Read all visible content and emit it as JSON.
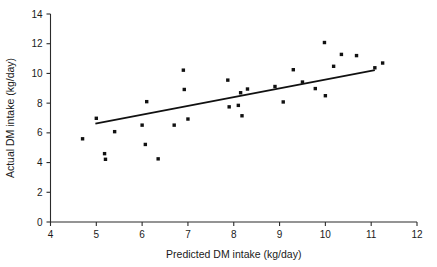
{
  "chart_data": {
    "type": "scatter",
    "title": "",
    "xlabel": "Predicted DM intake (kg/day)",
    "ylabel": "Actual DM intake (kg/day)",
    "xlim": [
      4,
      12
    ],
    "ylim": [
      0,
      14
    ],
    "xticks": [
      4,
      5,
      6,
      7,
      8,
      9,
      10,
      11,
      12
    ],
    "yticks": [
      0,
      2,
      4,
      6,
      8,
      10,
      12,
      14
    ],
    "xtick_labels": [
      "4",
      "5",
      "6",
      "7",
      "8",
      "9",
      "10",
      "11",
      "12"
    ],
    "ytick_labels": [
      "0",
      "2",
      "4",
      "6",
      "8",
      "10",
      "12",
      "14"
    ],
    "grid": false,
    "legend": false,
    "legend_position": "none",
    "marker": "square",
    "marker_color": "#111111",
    "marker_size": 3.4,
    "points": [
      {
        "x": 4.7,
        "y": 5.6
      },
      {
        "x": 5.0,
        "y": 6.98
      },
      {
        "x": 5.18,
        "y": 4.6
      },
      {
        "x": 5.2,
        "y": 4.22
      },
      {
        "x": 5.4,
        "y": 6.08
      },
      {
        "x": 6.0,
        "y": 6.52
      },
      {
        "x": 6.07,
        "y": 5.22
      },
      {
        "x": 6.1,
        "y": 8.1
      },
      {
        "x": 6.35,
        "y": 4.25
      },
      {
        "x": 6.7,
        "y": 6.52
      },
      {
        "x": 6.9,
        "y": 10.22
      },
      {
        "x": 6.92,
        "y": 8.92
      },
      {
        "x": 7.0,
        "y": 6.93
      },
      {
        "x": 7.87,
        "y": 9.55
      },
      {
        "x": 7.9,
        "y": 7.75
      },
      {
        "x": 8.1,
        "y": 7.85
      },
      {
        "x": 8.15,
        "y": 8.7
      },
      {
        "x": 8.18,
        "y": 7.15
      },
      {
        "x": 8.3,
        "y": 8.95
      },
      {
        "x": 8.9,
        "y": 9.12
      },
      {
        "x": 9.08,
        "y": 8.08
      },
      {
        "x": 9.3,
        "y": 10.25
      },
      {
        "x": 9.5,
        "y": 9.42
      },
      {
        "x": 9.78,
        "y": 8.98
      },
      {
        "x": 9.98,
        "y": 12.08
      },
      {
        "x": 10.0,
        "y": 8.5
      },
      {
        "x": 10.18,
        "y": 10.48
      },
      {
        "x": 10.35,
        "y": 11.28
      },
      {
        "x": 10.68,
        "y": 11.2
      },
      {
        "x": 11.08,
        "y": 10.38
      },
      {
        "x": 11.25,
        "y": 10.7
      }
    ],
    "trend_line": {
      "x0": 4.98,
      "y0": 6.62,
      "x1": 11.08,
      "y1": 10.22,
      "color": "#111111"
    }
  }
}
